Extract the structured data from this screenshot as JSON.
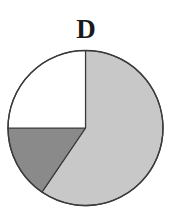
{
  "chart_data": {
    "type": "pie",
    "title": "D",
    "start_angle_deg": 0,
    "direction": "clockwise",
    "slices": [
      {
        "label": "",
        "value": 59.5,
        "color": "#c8c8c8"
      },
      {
        "label": "",
        "value": 15.5,
        "color": "#8a8a8a"
      },
      {
        "label": "",
        "value": 25.0,
        "color": "#ffffff"
      }
    ],
    "legend": []
  }
}
